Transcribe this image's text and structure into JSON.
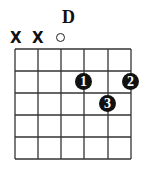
{
  "chord": {
    "name": "D",
    "string_markers": [
      "X",
      "X",
      "O",
      "",
      "",
      ""
    ],
    "fingers": [
      {
        "label": "1",
        "string": 4,
        "fret": 2
      },
      {
        "label": "2",
        "string": 6,
        "fret": 2
      },
      {
        "label": "3",
        "string": 5,
        "fret": 3
      }
    ],
    "strings": 6,
    "frets": 5
  }
}
